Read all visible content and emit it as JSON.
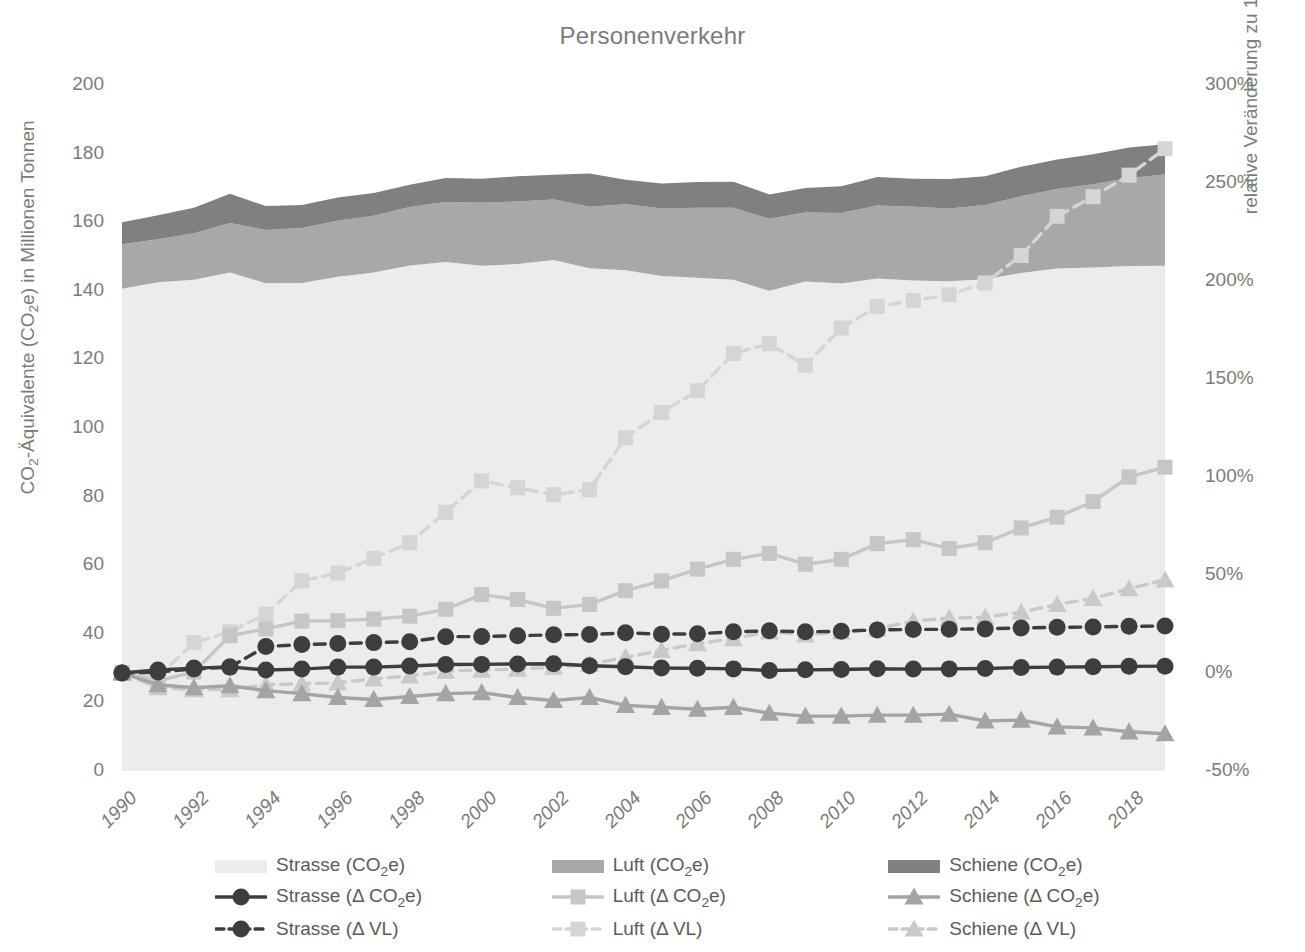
{
  "chart_data": {
    "type": "area",
    "title": "Personenverkehr",
    "xlabel": "",
    "ylabel": "CO2-Äquivalente (CO2e) in Millionen Tonnen",
    "ylabel_right": "relative Veränderung zu 1990",
    "x": [
      1990,
      1991,
      1992,
      1993,
      1994,
      1995,
      1996,
      1997,
      1998,
      1999,
      2000,
      2001,
      2002,
      2003,
      2004,
      2005,
      2006,
      2007,
      2008,
      2009,
      2010,
      2011,
      2012,
      2013,
      2014,
      2015,
      2016,
      2017,
      2018,
      2019
    ],
    "ylim": [
      0,
      200
    ],
    "yticks": [
      0,
      20,
      40,
      60,
      80,
      100,
      120,
      140,
      160,
      180,
      200
    ],
    "ylim_right": [
      -50,
      300
    ],
    "yticks_right": [
      -50,
      0,
      50,
      100,
      150,
      200,
      250,
      300
    ],
    "xticks": [
      1990,
      1992,
      1994,
      1996,
      1998,
      2000,
      2002,
      2004,
      2006,
      2008,
      2010,
      2012,
      2014,
      2016,
      2018
    ],
    "grid": false,
    "legend_position": "bottom",
    "series": [
      {
        "name": "Strasse (CO2e)",
        "kind": "area",
        "axis": "left",
        "color": "#ececec",
        "values": [
          140.6,
          142.5,
          143.2,
          145.3,
          142.2,
          142.3,
          144.1,
          145.3,
          147.4,
          148.4,
          147.3,
          147.8,
          149.0,
          146.6,
          146.0,
          144.3,
          143.8,
          143.2,
          140.0,
          142.7,
          142.1,
          143.6,
          143.0,
          142.8,
          143.4,
          145.2,
          146.5,
          146.8,
          147.2,
          147.3
        ]
      },
      {
        "name": "Luft  (CO2e)",
        "kind": "area",
        "axis": "left",
        "color": "#a8a8a8",
        "values": [
          13.0,
          12.5,
          13.6,
          14.5,
          15.5,
          16.0,
          16.3,
          16.6,
          17.0,
          17.5,
          18.4,
          18.2,
          17.6,
          17.9,
          19.2,
          19.7,
          20.4,
          21.0,
          21.0,
          20.1,
          20.6,
          21.3,
          21.5,
          21.2,
          21.6,
          22.4,
          23.2,
          24.3,
          25.7,
          26.6
        ]
      },
      {
        "name": "Schiene (CO2e)",
        "kind": "area",
        "axis": "left",
        "color": "#808080",
        "values": [
          6.4,
          7.0,
          7.4,
          8.5,
          7.0,
          6.7,
          6.8,
          6.6,
          6.5,
          7.0,
          7.0,
          7.4,
          7.2,
          9.7,
          7.2,
          7.3,
          7.5,
          7.6,
          7.1,
          7.2,
          7.8,
          8.3,
          8.2,
          8.6,
          8.4,
          8.6,
          8.6,
          8.7,
          8.9,
          8.8
        ]
      },
      {
        "name": "Strasse (Δ CO2e)",
        "kind": "line",
        "axis": "right",
        "color": "#3d3d3d",
        "dash": false,
        "marker": "circle",
        "values": [
          0,
          1.5,
          2.5,
          3.1,
          1.5,
          2.0,
          3.0,
          3.0,
          3.6,
          4.3,
          4.4,
          4.6,
          4.7,
          3.7,
          3.2,
          2.5,
          2.4,
          2.1,
          1.3,
          1.6,
          1.8,
          2.2,
          2.0,
          2.1,
          2.3,
          2.8,
          3.0,
          3.2,
          3.4,
          3.5
        ]
      },
      {
        "name": "Luft  (Δ CO2e)",
        "kind": "line",
        "axis": "right",
        "color": "#c6c6c6",
        "dash": false,
        "marker": "square",
        "values": [
          0,
          -4.0,
          0.5,
          19.0,
          22.5,
          26.5,
          26.7,
          27.5,
          29.0,
          32.5,
          40.0,
          37.5,
          33.0,
          35.0,
          42.0,
          47.0,
          53.0,
          58.0,
          61.0,
          55.5,
          58.0,
          66.0,
          68.0,
          63.5,
          66.5,
          74.0,
          79.5,
          87.5,
          100.0,
          105.0
        ]
      },
      {
        "name": "Schiene  (Δ CO2e)",
        "kind": "line",
        "axis": "right",
        "color": "#a4a4a4",
        "dash": false,
        "marker": "triangle",
        "values": [
          0,
          -6.0,
          -7.5,
          -6.5,
          -9.0,
          -10.5,
          -12.5,
          -13.5,
          -12.0,
          -10.5,
          -10.0,
          -12.5,
          -14.0,
          -12.5,
          -16.5,
          -17.5,
          -18.5,
          -17.5,
          -20.5,
          -22.0,
          -22.0,
          -21.5,
          -21.5,
          -21.0,
          -24.5,
          -24.0,
          -27.5,
          -28.0,
          -30.0,
          -31.0
        ]
      },
      {
        "name": "Strasse (Δ VL)",
        "kind": "line",
        "axis": "right",
        "color": "#3d3d3d",
        "dash": true,
        "marker": "circle",
        "values": [
          0,
          0.5,
          2.0,
          3.0,
          13.5,
          14.5,
          15.0,
          15.5,
          16.0,
          18.5,
          18.6,
          19.0,
          19.5,
          19.6,
          20.5,
          19.8,
          20.0,
          21.0,
          21.5,
          21.0,
          21.3,
          22.0,
          22.2,
          22.3,
          22.5,
          23.0,
          23.3,
          23.5,
          23.8,
          24.0
        ]
      },
      {
        "name": "Luft (Δ VL)",
        "kind": "line",
        "axis": "right",
        "color": "#d5d5d5",
        "dash": true,
        "marker": "square",
        "values": [
          0,
          -2.0,
          15.5,
          21.0,
          30.0,
          47.0,
          51.0,
          58.5,
          66.5,
          82.0,
          98.0,
          94.5,
          91.0,
          93.5,
          120.0,
          133.0,
          144.0,
          163.0,
          168.0,
          157.0,
          176.0,
          187.0,
          190.0,
          193.0,
          199.0,
          213.0,
          233.0,
          243.0,
          254.0,
          267.5
        ]
      },
      {
        "name": "Schiene (Δ VL)",
        "kind": "line",
        "axis": "right",
        "color": "#c9c9c9",
        "dash": true,
        "marker": "triangle",
        "values": [
          0,
          -7.5,
          -8.5,
          -8.5,
          -6.0,
          -5.5,
          -5.0,
          -3.0,
          -1.5,
          1.0,
          1.5,
          2.0,
          3.0,
          4.5,
          8.0,
          11.5,
          15.0,
          17.5,
          21.0,
          19.5,
          21.0,
          22.5,
          26.5,
          28.0,
          28.5,
          31.0,
          35.0,
          38.0,
          43.0,
          47.5
        ]
      }
    ]
  },
  "axes": {
    "y_left_ticks": [
      "200",
      "180",
      "160",
      "140",
      "120",
      "100",
      "80",
      "60",
      "40",
      "20",
      "0"
    ],
    "y_right_ticks": [
      "300%",
      "250%",
      "200%",
      "150%",
      "100%",
      "50%",
      "0%",
      "-50%"
    ],
    "x_ticks": [
      "1990",
      "1992",
      "1994",
      "1996",
      "1998",
      "2000",
      "2002",
      "2004",
      "2006",
      "2008",
      "2010",
      "2012",
      "2014",
      "2016",
      "2018"
    ],
    "y_left_title_pre": "CO",
    "y_left_title_sub1": "2",
    "y_left_title_mid": "-Äquivalente (CO",
    "y_left_title_sub2": "2",
    "y_left_title_post": "e) in Millionen Tonnen",
    "y_right_title": "relative Veränderung zu 1990"
  },
  "legend": {
    "items": [
      {
        "label_pre": "Strasse (CO",
        "sub": "2",
        "label_post": "e)",
        "type": "area",
        "color": "#ececec",
        "name": "strasse-co2e"
      },
      {
        "label_pre": "Luft  (CO",
        "sub": "2",
        "label_post": "e)",
        "type": "area",
        "color": "#a8a8a8",
        "name": "luft-co2e"
      },
      {
        "label_pre": "Schiene (CO",
        "sub": "2",
        "label_post": "e)",
        "type": "area",
        "color": "#808080",
        "name": "schiene-co2e"
      },
      {
        "label_pre": "Strasse (Δ CO",
        "sub": "2",
        "label_post": "e)",
        "type": "line-circle",
        "color": "#3d3d3d",
        "dash": false,
        "name": "strasse-delta-co2e"
      },
      {
        "label_pre": "Luft  (Δ CO",
        "sub": "2",
        "label_post": "e)",
        "type": "line-square",
        "color": "#c6c6c6",
        "dash": false,
        "name": "luft-delta-co2e"
      },
      {
        "label_pre": "Schiene  (Δ CO",
        "sub": "2",
        "label_post": "e)",
        "type": "line-triangle",
        "color": "#a4a4a4",
        "dash": false,
        "name": "schiene-delta-co2e"
      },
      {
        "label_pre": "Strasse (Δ VL)",
        "sub": "",
        "label_post": "",
        "type": "line-circle",
        "color": "#3d3d3d",
        "dash": true,
        "name": "strasse-delta-vl"
      },
      {
        "label_pre": "Luft (Δ VL)",
        "sub": "",
        "label_post": "",
        "type": "line-square",
        "color": "#d5d5d5",
        "dash": true,
        "name": "luft-delta-vl"
      },
      {
        "label_pre": "Schiene (Δ VL)",
        "sub": "",
        "label_post": "",
        "type": "line-triangle",
        "color": "#c9c9c9",
        "dash": true,
        "name": "schiene-delta-vl"
      }
    ]
  },
  "colors": {
    "text": "#7b7b7b",
    "area_strasse": "#ececec",
    "area_luft": "#a8a8a8",
    "area_schiene": "#808080",
    "line_dark": "#3d3d3d",
    "line_mid": "#a4a4a4",
    "line_light": "#d5d5d5",
    "background": "#ffffff"
  }
}
